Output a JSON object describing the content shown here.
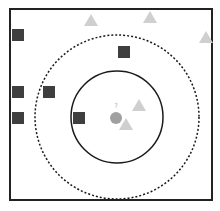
{
  "diagram": {
    "query_label": "?",
    "colors": {
      "frame": "#222222",
      "square": "#3f3f3f",
      "triangle": "#cfcfcf",
      "query": "#a0a0a0",
      "inner_circle": "#1a1a1a",
      "outer_circle": "#1a1a1a"
    },
    "frame": {
      "x": 10,
      "y": 9,
      "w": 202,
      "h": 191
    },
    "query_point": {
      "cx": 116,
      "cy": 118,
      "r": 6
    },
    "inner_circle": {
      "cx": 117,
      "cy": 117,
      "r": 46,
      "style": "solid"
    },
    "outer_circle": {
      "cx": 117,
      "cy": 117,
      "r": 82,
      "style": "dashed"
    },
    "squares": [
      {
        "x": 12,
        "y": 29
      },
      {
        "x": 118,
        "y": 46
      },
      {
        "x": 12,
        "y": 86
      },
      {
        "x": 43,
        "y": 86
      },
      {
        "x": 12,
        "y": 112
      },
      {
        "x": 73,
        "y": 112
      }
    ],
    "triangles": [
      {
        "cx": 91,
        "cy": 21
      },
      {
        "cx": 150,
        "cy": 18
      },
      {
        "cx": 206,
        "cy": 38
      },
      {
        "cx": 139,
        "cy": 106
      },
      {
        "cx": 126,
        "cy": 125
      }
    ]
  }
}
